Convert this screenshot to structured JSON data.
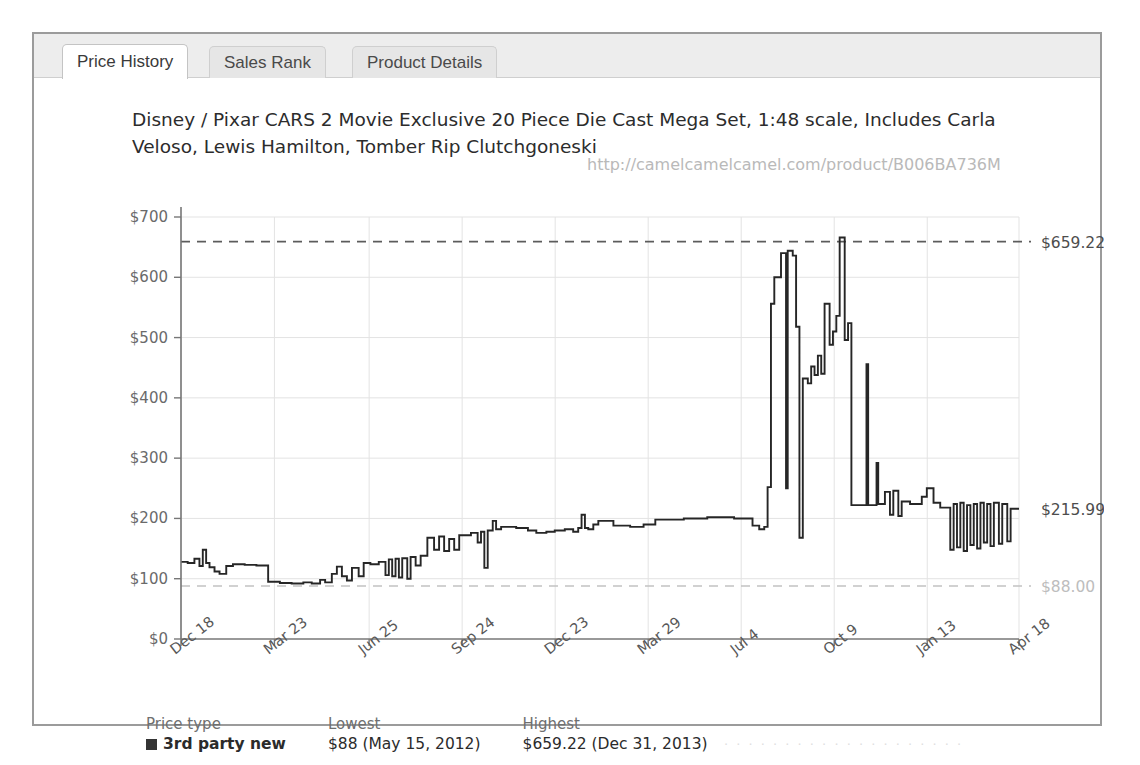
{
  "window": {
    "tabs": [
      {
        "id": "price-history",
        "label": "Price History",
        "active": true
      },
      {
        "id": "sales-rank",
        "label": "Sales Rank",
        "active": false
      },
      {
        "id": "product-details",
        "label": "Product Details",
        "active": false
      }
    ]
  },
  "chart_data": {
    "type": "line",
    "title": "Disney / Pixar CARS 2 Movie Exclusive 20 Piece Die Cast Mega Set, 1:48 scale, Includes Carla Veloso, Lewis Hamilton, Tomber Rip Clutchgoneski",
    "watermark": "http://camelcamelcamel.com/product/B006BA736M",
    "xlabel": "",
    "ylabel": "",
    "ylim": [
      0,
      700
    ],
    "grid": true,
    "legend_position": "bottom-left",
    "y_ticks": [
      "$0",
      "$100",
      "$200",
      "$300",
      "$400",
      "$500",
      "$600",
      "$700"
    ],
    "y_tick_values": [
      0,
      100,
      200,
      300,
      400,
      500,
      600,
      700
    ],
    "x_ticks": [
      "Dec 18",
      "Mar 23",
      "Jun 25",
      "Sep 24",
      "Dec 23",
      "Mar 29",
      "Jul 4",
      "Oct 9",
      "Jan 13",
      "Apr 18"
    ],
    "x_tick_positions": [
      0.0,
      0.1115,
      0.2245,
      0.3355,
      0.4465,
      0.5575,
      0.6685,
      0.7795,
      0.8905,
      1.0
    ],
    "year_marks": [
      {
        "label": "2011",
        "pos": 0.018
      },
      {
        "label": "2012",
        "pos": 0.072
      },
      {
        "label": "2013",
        "pos": 0.418
      },
      {
        "label": "2014",
        "pos": 0.815
      }
    ],
    "reference_lines": [
      {
        "label": "$659.22",
        "value": 659.22,
        "style": "dashed",
        "color": "#5c5c5c"
      },
      {
        "label": "$215.99",
        "value": 215.99,
        "style": "none",
        "color": "#4d4d4d"
      },
      {
        "label": "$88.00",
        "value": 88.0,
        "style": "dashed",
        "color": "#c2c2c2"
      }
    ],
    "series": [
      {
        "name": "3rd party new",
        "color": "#262626",
        "step": true,
        "points": [
          [
            0.0,
            128
          ],
          [
            0.008,
            128
          ],
          [
            0.008,
            126
          ],
          [
            0.016,
            126
          ],
          [
            0.016,
            133
          ],
          [
            0.022,
            133
          ],
          [
            0.022,
            121
          ],
          [
            0.026,
            121
          ],
          [
            0.026,
            148
          ],
          [
            0.03,
            148
          ],
          [
            0.03,
            126
          ],
          [
            0.034,
            126
          ],
          [
            0.034,
            119
          ],
          [
            0.04,
            119
          ],
          [
            0.04,
            112
          ],
          [
            0.046,
            112
          ],
          [
            0.046,
            108
          ],
          [
            0.054,
            108
          ],
          [
            0.054,
            121
          ],
          [
            0.062,
            121
          ],
          [
            0.062,
            124
          ],
          [
            0.076,
            124
          ],
          [
            0.076,
            123
          ],
          [
            0.09,
            123
          ],
          [
            0.09,
            122
          ],
          [
            0.104,
            122
          ],
          [
            0.104,
            95
          ],
          [
            0.118,
            95
          ],
          [
            0.118,
            93
          ],
          [
            0.132,
            93
          ],
          [
            0.132,
            92
          ],
          [
            0.146,
            92
          ],
          [
            0.146,
            94
          ],
          [
            0.156,
            94
          ],
          [
            0.156,
            92
          ],
          [
            0.166,
            92
          ],
          [
            0.166,
            98
          ],
          [
            0.172,
            98
          ],
          [
            0.172,
            94
          ],
          [
            0.18,
            94
          ],
          [
            0.18,
            108
          ],
          [
            0.186,
            108
          ],
          [
            0.186,
            120
          ],
          [
            0.192,
            120
          ],
          [
            0.192,
            104
          ],
          [
            0.198,
            104
          ],
          [
            0.198,
            97
          ],
          [
            0.204,
            97
          ],
          [
            0.204,
            118
          ],
          [
            0.212,
            118
          ],
          [
            0.212,
            104
          ],
          [
            0.218,
            104
          ],
          [
            0.218,
            126
          ],
          [
            0.226,
            126
          ],
          [
            0.226,
            124
          ],
          [
            0.236,
            124
          ],
          [
            0.236,
            128
          ],
          [
            0.244,
            128
          ],
          [
            0.244,
            106
          ],
          [
            0.248,
            106
          ],
          [
            0.248,
            132
          ],
          [
            0.252,
            132
          ],
          [
            0.252,
            104
          ],
          [
            0.256,
            104
          ],
          [
            0.256,
            133
          ],
          [
            0.26,
            133
          ],
          [
            0.26,
            102
          ],
          [
            0.264,
            102
          ],
          [
            0.264,
            134
          ],
          [
            0.27,
            134
          ],
          [
            0.27,
            100
          ],
          [
            0.274,
            100
          ],
          [
            0.274,
            136
          ],
          [
            0.28,
            136
          ],
          [
            0.28,
            122
          ],
          [
            0.286,
            122
          ],
          [
            0.286,
            138
          ],
          [
            0.294,
            138
          ],
          [
            0.294,
            168
          ],
          [
            0.302,
            168
          ],
          [
            0.302,
            148
          ],
          [
            0.308,
            148
          ],
          [
            0.308,
            170
          ],
          [
            0.314,
            170
          ],
          [
            0.314,
            146
          ],
          [
            0.32,
            146
          ],
          [
            0.32,
            166
          ],
          [
            0.326,
            166
          ],
          [
            0.326,
            148
          ],
          [
            0.332,
            148
          ],
          [
            0.332,
            172
          ],
          [
            0.346,
            172
          ],
          [
            0.346,
            176
          ],
          [
            0.354,
            176
          ],
          [
            0.354,
            160
          ],
          [
            0.358,
            160
          ],
          [
            0.358,
            178
          ],
          [
            0.362,
            178
          ],
          [
            0.362,
            118
          ],
          [
            0.366,
            118
          ],
          [
            0.366,
            180
          ],
          [
            0.372,
            180
          ],
          [
            0.372,
            196
          ],
          [
            0.376,
            196
          ],
          [
            0.376,
            182
          ],
          [
            0.382,
            182
          ],
          [
            0.382,
            186
          ],
          [
            0.4,
            186
          ],
          [
            0.4,
            184
          ],
          [
            0.414,
            184
          ],
          [
            0.414,
            180
          ],
          [
            0.424,
            180
          ],
          [
            0.424,
            176
          ],
          [
            0.436,
            176
          ],
          [
            0.436,
            178
          ],
          [
            0.446,
            178
          ],
          [
            0.446,
            180
          ],
          [
            0.458,
            180
          ],
          [
            0.458,
            182
          ],
          [
            0.468,
            182
          ],
          [
            0.468,
            178
          ],
          [
            0.474,
            178
          ],
          [
            0.474,
            184
          ],
          [
            0.478,
            184
          ],
          [
            0.478,
            206
          ],
          [
            0.482,
            206
          ],
          [
            0.482,
            184
          ],
          [
            0.486,
            184
          ],
          [
            0.486,
            182
          ],
          [
            0.492,
            182
          ],
          [
            0.492,
            190
          ],
          [
            0.498,
            190
          ],
          [
            0.498,
            196
          ],
          [
            0.516,
            196
          ],
          [
            0.516,
            188
          ],
          [
            0.536,
            188
          ],
          [
            0.536,
            186
          ],
          [
            0.552,
            186
          ],
          [
            0.552,
            190
          ],
          [
            0.566,
            190
          ],
          [
            0.566,
            198
          ],
          [
            0.6,
            198
          ],
          [
            0.6,
            200
          ],
          [
            0.628,
            200
          ],
          [
            0.628,
            202
          ],
          [
            0.66,
            202
          ],
          [
            0.66,
            200
          ],
          [
            0.682,
            200
          ],
          [
            0.682,
            188
          ],
          [
            0.69,
            188
          ],
          [
            0.69,
            182
          ],
          [
            0.696,
            182
          ],
          [
            0.696,
            186
          ],
          [
            0.7,
            186
          ],
          [
            0.7,
            252
          ],
          [
            0.704,
            252
          ],
          [
            0.704,
            556
          ],
          [
            0.708,
            556
          ],
          [
            0.708,
            600
          ],
          [
            0.716,
            600
          ],
          [
            0.716,
            640
          ],
          [
            0.722,
            640
          ],
          [
            0.722,
            250
          ],
          [
            0.724,
            250
          ],
          [
            0.724,
            644
          ],
          [
            0.73,
            644
          ],
          [
            0.73,
            636
          ],
          [
            0.734,
            636
          ],
          [
            0.734,
            518
          ],
          [
            0.738,
            518
          ],
          [
            0.738,
            168
          ],
          [
            0.742,
            168
          ],
          [
            0.742,
            432
          ],
          [
            0.748,
            432
          ],
          [
            0.748,
            424
          ],
          [
            0.752,
            424
          ],
          [
            0.752,
            452
          ],
          [
            0.756,
            452
          ],
          [
            0.756,
            438
          ],
          [
            0.76,
            438
          ],
          [
            0.76,
            470
          ],
          [
            0.764,
            470
          ],
          [
            0.764,
            440
          ],
          [
            0.768,
            440
          ],
          [
            0.768,
            556
          ],
          [
            0.774,
            556
          ],
          [
            0.774,
            488
          ],
          [
            0.778,
            488
          ],
          [
            0.778,
            510
          ],
          [
            0.782,
            510
          ],
          [
            0.782,
            536
          ],
          [
            0.786,
            536
          ],
          [
            0.786,
            666
          ],
          [
            0.792,
            666
          ],
          [
            0.792,
            496
          ],
          [
            0.796,
            496
          ],
          [
            0.796,
            524
          ],
          [
            0.8,
            524
          ],
          [
            0.8,
            222
          ],
          [
            0.818,
            222
          ],
          [
            0.818,
            456
          ],
          [
            0.82,
            456
          ],
          [
            0.82,
            222
          ],
          [
            0.83,
            222
          ],
          [
            0.83,
            292
          ],
          [
            0.832,
            292
          ],
          [
            0.832,
            224
          ],
          [
            0.84,
            224
          ],
          [
            0.84,
            244
          ],
          [
            0.846,
            244
          ],
          [
            0.846,
            206
          ],
          [
            0.85,
            206
          ],
          [
            0.85,
            246
          ],
          [
            0.856,
            246
          ],
          [
            0.856,
            204
          ],
          [
            0.86,
            204
          ],
          [
            0.86,
            228
          ],
          [
            0.87,
            228
          ],
          [
            0.87,
            224
          ],
          [
            0.884,
            224
          ],
          [
            0.884,
            236
          ],
          [
            0.89,
            236
          ],
          [
            0.89,
            250
          ],
          [
            0.898,
            250
          ],
          [
            0.898,
            226
          ],
          [
            0.906,
            226
          ],
          [
            0.906,
            218
          ],
          [
            0.918,
            218
          ],
          [
            0.918,
            148
          ],
          [
            0.922,
            148
          ],
          [
            0.922,
            224
          ],
          [
            0.926,
            224
          ],
          [
            0.926,
            152
          ],
          [
            0.93,
            152
          ],
          [
            0.93,
            226
          ],
          [
            0.934,
            226
          ],
          [
            0.934,
            146
          ],
          [
            0.938,
            146
          ],
          [
            0.938,
            222
          ],
          [
            0.942,
            222
          ],
          [
            0.942,
            156
          ],
          [
            0.946,
            156
          ],
          [
            0.946,
            224
          ],
          [
            0.95,
            224
          ],
          [
            0.95,
            150
          ],
          [
            0.954,
            150
          ],
          [
            0.954,
            226
          ],
          [
            0.958,
            226
          ],
          [
            0.958,
            160
          ],
          [
            0.962,
            160
          ],
          [
            0.962,
            224
          ],
          [
            0.966,
            224
          ],
          [
            0.966,
            154
          ],
          [
            0.97,
            154
          ],
          [
            0.97,
            226
          ],
          [
            0.976,
            226
          ],
          [
            0.976,
            158
          ],
          [
            0.98,
            158
          ],
          [
            0.98,
            224
          ],
          [
            0.986,
            224
          ],
          [
            0.986,
            162
          ],
          [
            0.99,
            162
          ],
          [
            0.99,
            216
          ],
          [
            1.0,
            216
          ]
        ]
      }
    ]
  },
  "legend": {
    "headers": [
      "Price type",
      "Lowest",
      "Highest"
    ],
    "rows": [
      {
        "type": "3rd party new",
        "lowest": "$88 (May 15, 2012)",
        "highest": "$659.22 (Dec 31, 2013)",
        "color": "#343434"
      }
    ]
  }
}
